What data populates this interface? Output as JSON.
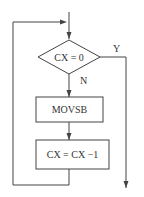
{
  "diagram": {
    "type": "flowchart",
    "nodes": [
      {
        "id": "decision",
        "shape": "diamond",
        "label": "CX = 0"
      },
      {
        "id": "process1",
        "shape": "rect",
        "label": "MOVSB"
      },
      {
        "id": "process2",
        "shape": "rect",
        "label": "CX = CX −1"
      }
    ],
    "edges": [
      {
        "from": "entry",
        "to": "decision",
        "label": ""
      },
      {
        "from": "decision",
        "to": "exit",
        "label": "Y"
      },
      {
        "from": "decision",
        "to": "process1",
        "label": "N"
      },
      {
        "from": "process1",
        "to": "process2",
        "label": ""
      },
      {
        "from": "process2",
        "to": "decision",
        "label": "",
        "kind": "loop-back"
      }
    ],
    "labels": {
      "yes": "Y",
      "no": "N"
    },
    "colors": {
      "line": "#444444",
      "background": "#ffffff"
    }
  }
}
